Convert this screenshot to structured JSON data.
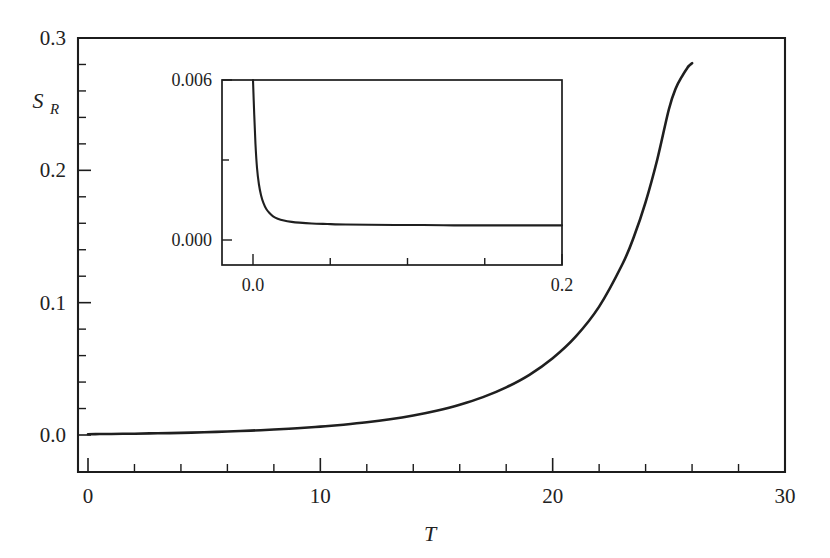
{
  "chart_data": {
    "type": "line",
    "title": "",
    "xlabel": "T",
    "ylabel": "S_R",
    "ylabel_base": "S",
    "ylabel_sub": "R",
    "xlim": [
      0,
      30
    ],
    "ylim": [
      0,
      0.3
    ],
    "grid": false,
    "legend": "none",
    "x_ticks_major": [
      0,
      10,
      20,
      30
    ],
    "x_ticklabels": [
      "0",
      "10",
      "20",
      "30"
    ],
    "x_tick_minor_step": 2,
    "y_ticks_major": [
      0.0,
      0.1,
      0.2,
      0.3
    ],
    "y_ticklabels": [
      "0.0",
      "0.1",
      "0.2",
      "0.3"
    ],
    "y_tick_minor_step": 0.02,
    "series": [
      {
        "name": "S_R(T)",
        "color": "#1f1f1f",
        "x": [
          0.0,
          0.5,
          1.0,
          1.5,
          2.0,
          3.0,
          4.0,
          5.0,
          6.0,
          7.0,
          8.0,
          9.0,
          10.0,
          11.0,
          12.0,
          13.0,
          14.0,
          15.0,
          16.0,
          17.0,
          18.0,
          19.0,
          20.0,
          21.0,
          22.0,
          23.0,
          23.5,
          24.0,
          24.5,
          25.0,
          25.3,
          25.6,
          25.8,
          25.9,
          26.0
        ],
        "y": [
          0.0006,
          0.0007,
          0.0008,
          0.0009,
          0.001,
          0.0013,
          0.0016,
          0.0021,
          0.0026,
          0.0033,
          0.0041,
          0.0051,
          0.0063,
          0.0078,
          0.0096,
          0.0119,
          0.0148,
          0.0184,
          0.0229,
          0.0286,
          0.036,
          0.0455,
          0.058,
          0.0745,
          0.097,
          0.129,
          0.15,
          0.176,
          0.208,
          0.246,
          0.262,
          0.272,
          0.2775,
          0.2795,
          0.281
        ]
      }
    ],
    "inset": {
      "type": "line",
      "xlim": [
        -0.02,
        0.2
      ],
      "ylim": [
        -0.0008,
        0.006
      ],
      "x_ticks_major": [
        0.0,
        0.2
      ],
      "x_ticklabels": [
        "0.0",
        "0.2"
      ],
      "x_tick_minor_step": 0.05,
      "y_ticks_major": [
        0.0,
        0.006
      ],
      "y_ticklabels": [
        "0.000",
        "0.006"
      ],
      "y_tick_minor_step": 0.003,
      "series": [
        {
          "name": "S_R(T) small-T",
          "color": "#1f1f1f",
          "x": [
            0.0,
            0.0008,
            0.0016,
            0.0026,
            0.0038,
            0.0052,
            0.0068,
            0.0086,
            0.0105,
            0.013,
            0.016,
            0.02,
            0.025,
            0.03,
            0.038,
            0.048,
            0.06,
            0.075,
            0.092,
            0.11,
            0.13,
            0.15,
            0.17,
            0.185,
            0.2
          ],
          "y": [
            0.006,
            0.0047,
            0.0036,
            0.0027,
            0.0021,
            0.00168,
            0.00138,
            0.00116,
            0.00102,
            0.00089,
            0.0008,
            0.00073,
            0.00068,
            0.00065,
            0.00062,
            0.0006,
            0.00058,
            0.00057,
            0.00056,
            0.00056,
            0.00055,
            0.00055,
            0.00055,
            0.00055,
            0.00055
          ]
        }
      ]
    }
  }
}
